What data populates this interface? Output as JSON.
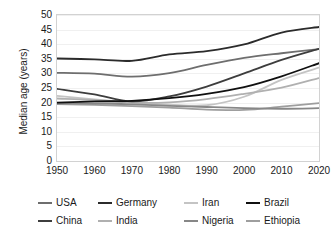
{
  "chart_data": {
    "type": "line",
    "title": "",
    "xlabel": "",
    "ylabel": "Median age (years)",
    "xlim": [
      1950,
      2020
    ],
    "ylim": [
      0,
      50
    ],
    "ytick_step": 5,
    "grid": true,
    "legend_position": "bottom",
    "x": [
      1950,
      1960,
      1970,
      1980,
      1990,
      2000,
      2010,
      2020
    ],
    "xticklabels": [
      "1950",
      "1960",
      "1970",
      "1980",
      "1990",
      "2000",
      "2010",
      "2020"
    ],
    "yticklabels": [
      "0",
      "5",
      "10",
      "15",
      "20",
      "25",
      "30",
      "35",
      "40",
      "45",
      "50"
    ],
    "series": [
      {
        "name": "USA",
        "color": "#6e6e6e",
        "width": 1.8,
        "values": [
          30.2,
          29.9,
          28.9,
          30.1,
          32.9,
          35.3,
          36.9,
          38.3
        ]
      },
      {
        "name": "Germany",
        "color": "#2b2b2b",
        "width": 1.8,
        "values": [
          35.1,
          34.8,
          34.3,
          36.5,
          37.6,
          39.9,
          44.0,
          45.9
        ]
      },
      {
        "name": "Iran",
        "color": "#c4c4c4",
        "width": 1.8,
        "values": [
          22.3,
          21.1,
          20.0,
          19.3,
          19.1,
          22.0,
          27.8,
          32.0
        ]
      },
      {
        "name": "Brazil",
        "color": "#101010",
        "width": 1.8,
        "values": [
          20.0,
          20.4,
          20.6,
          21.5,
          23.0,
          25.3,
          29.0,
          33.5
        ]
      },
      {
        "name": "China",
        "color": "#3d3d3d",
        "width": 1.8,
        "values": [
          24.7,
          22.8,
          20.4,
          22.1,
          25.5,
          30.0,
          34.6,
          38.4
        ]
      },
      {
        "name": "India",
        "color": "#b0b0b0",
        "width": 1.8,
        "values": [
          21.4,
          20.9,
          20.0,
          20.1,
          21.2,
          23.0,
          25.1,
          28.4
        ]
      },
      {
        "name": "Nigeria",
        "color": "#878787",
        "width": 1.8,
        "values": [
          19.7,
          19.7,
          19.4,
          18.9,
          18.5,
          18.1,
          17.9,
          18.1
        ]
      },
      {
        "name": "Ethiopia",
        "color": "#9e9e9e",
        "width": 1.8,
        "values": [
          19.5,
          19.2,
          18.8,
          18.3,
          17.6,
          17.5,
          18.6,
          19.8
        ]
      }
    ]
  },
  "axes": {
    "y_title": "Median age (years)"
  },
  "legend": {
    "rows": [
      [
        {
          "label": "USA",
          "color": "#6e6e6e",
          "width": 60
        },
        {
          "label": "Germany",
          "color": "#2b2b2b",
          "width": 86
        },
        {
          "label": "Iran",
          "color": "#c4c4c4",
          "width": 62
        },
        {
          "label": "Brazil",
          "color": "#101010",
          "width": 70
        }
      ],
      [
        {
          "label": "China",
          "color": "#3d3d3d",
          "width": 60
        },
        {
          "label": "India",
          "color": "#b0b0b0",
          "width": 86
        },
        {
          "label": "Nigeria",
          "color": "#878787",
          "width": 62
        },
        {
          "label": "Ethiopia",
          "color": "#9e9e9e",
          "width": 70
        }
      ]
    ]
  }
}
